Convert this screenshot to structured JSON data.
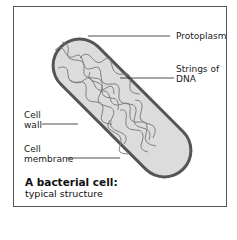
{
  "diagram": {
    "title": "A bacterial cell:",
    "subtitle": "typical structure",
    "labels": {
      "protoplasm": "Protoplasm",
      "dna_line1": "Strings of",
      "dna_line2": "DNA",
      "cell_wall_line1": "Cell",
      "cell_wall_line2": "wall",
      "cell_membrane_line1": "Cell",
      "cell_membrane_line2": "membrane"
    },
    "colors": {
      "wall": "#555555",
      "protoplasm": "#dcdcdc",
      "dna": "#777777",
      "frame": "#555555"
    }
  }
}
